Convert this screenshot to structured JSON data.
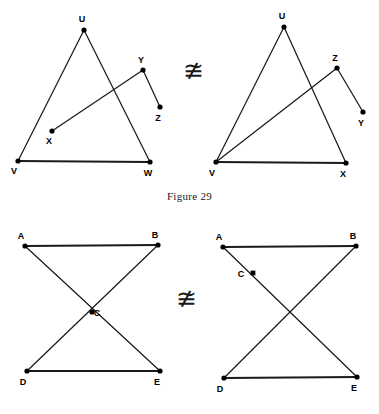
{
  "page": {
    "width": 379,
    "height": 414,
    "background_color": "#ffffff",
    "ink_color": "#1a1a1a"
  },
  "caption": {
    "text": "Figure 29"
  },
  "relations": [
    {
      "name": "top-relation",
      "symbol": "≇",
      "meaning": "not congruent to"
    },
    {
      "name": "bottom-relation",
      "symbol": "≇",
      "meaning": "not congruent to"
    }
  ],
  "figures": [
    {
      "id": "top-left",
      "row": "top",
      "side": "left",
      "viewbox": "0 0 190 188",
      "points": [
        {
          "id": "U",
          "label": "U",
          "x": 84,
          "y": 30,
          "marker": "dot",
          "label_dx": -2,
          "label_dy": -8
        },
        {
          "id": "V",
          "label": "V",
          "x": 18,
          "y": 161,
          "marker": "dot",
          "label_dx": -4,
          "label_dy": 13
        },
        {
          "id": "W",
          "label": "W",
          "x": 150,
          "y": 162,
          "marker": "dot",
          "label_dx": -2,
          "label_dy": 14
        },
        {
          "id": "X",
          "label": "X",
          "x": 52,
          "y": 131,
          "marker": "dot",
          "label_dx": -3,
          "label_dy": 13
        },
        {
          "id": "Y",
          "label": "Y",
          "x": 143,
          "y": 70,
          "marker": "dot",
          "label_dx": -2,
          "label_dy": -7
        },
        {
          "id": "Z",
          "label": "Z",
          "x": 160,
          "y": 107,
          "marker": "dot",
          "label_dx": -2,
          "label_dy": 14
        }
      ],
      "segments": [
        {
          "from": "U",
          "to": "V",
          "weight": "thin"
        },
        {
          "from": "U",
          "to": "W",
          "weight": "thin"
        },
        {
          "from": "V",
          "to": "W",
          "weight": "thick"
        },
        {
          "from": "X",
          "to": "Y",
          "weight": "thin"
        },
        {
          "from": "Y",
          "to": "Z",
          "weight": "thin"
        }
      ]
    },
    {
      "id": "top-right",
      "row": "top",
      "side": "right",
      "viewbox": "0 0 189 188",
      "points": [
        {
          "id": "U",
          "label": "U",
          "x": 94,
          "y": 27,
          "marker": "dot",
          "label_dx": -2,
          "label_dy": -8
        },
        {
          "id": "V",
          "label": "V",
          "x": 26,
          "y": 162,
          "marker": "dot",
          "label_dx": -4,
          "label_dy": 14
        },
        {
          "id": "X",
          "label": "X",
          "x": 156,
          "y": 163,
          "marker": "dot",
          "label_dx": -3,
          "label_dy": 14
        },
        {
          "id": "Z",
          "label": "Z",
          "x": 147,
          "y": 68,
          "marker": "dot",
          "label_dx": -2,
          "label_dy": -7
        },
        {
          "id": "Y",
          "label": "Y",
          "x": 173,
          "y": 112,
          "marker": "dot",
          "label_dx": -2,
          "label_dy": 14
        }
      ],
      "segments": [
        {
          "from": "U",
          "to": "V",
          "weight": "thin"
        },
        {
          "from": "U",
          "to": "X",
          "weight": "thin"
        },
        {
          "from": "V",
          "to": "X",
          "weight": "thick"
        },
        {
          "from": "V",
          "to": "Z",
          "weight": "thin"
        },
        {
          "from": "Z",
          "to": "Y",
          "weight": "thin"
        }
      ]
    },
    {
      "id": "bottom-left",
      "row": "bottom",
      "side": "left",
      "viewbox": "0 0 190 196",
      "points": [
        {
          "id": "A",
          "label": "A",
          "x": 25,
          "y": 28,
          "marker": "dot",
          "label_dx": -4,
          "label_dy": -7
        },
        {
          "id": "B",
          "label": "B",
          "x": 158,
          "y": 27,
          "marker": "dot",
          "label_dx": -3,
          "label_dy": -7
        },
        {
          "id": "C",
          "label": "C",
          "x": 92,
          "y": 94,
          "marker": "dot",
          "label_dx": 5,
          "label_dy": 4
        },
        {
          "id": "D",
          "label": "D",
          "x": 27,
          "y": 153,
          "marker": "dot",
          "label_dx": -4,
          "label_dy": 14
        },
        {
          "id": "E",
          "label": "E",
          "x": 160,
          "y": 153,
          "marker": "dot",
          "label_dx": -3,
          "label_dy": 14
        }
      ],
      "segments": [
        {
          "from": "A",
          "to": "B",
          "weight": "thick"
        },
        {
          "from": "A",
          "to": "E",
          "weight": "thin"
        },
        {
          "from": "B",
          "to": "D",
          "weight": "thin"
        },
        {
          "from": "D",
          "to": "E",
          "weight": "thick"
        }
      ]
    },
    {
      "id": "bottom-right",
      "row": "bottom",
      "side": "right",
      "viewbox": "0 0 189 196",
      "points": [
        {
          "id": "A",
          "label": "A",
          "x": 33,
          "y": 29,
          "marker": "dot",
          "label_dx": -4,
          "label_dy": -7
        },
        {
          "id": "B",
          "label": "B",
          "x": 166,
          "y": 28,
          "marker": "dot",
          "label_dx": -3,
          "label_dy": -7
        },
        {
          "id": "C",
          "label": "C",
          "x": 63,
          "y": 55,
          "marker": "square",
          "label_dx": -12,
          "label_dy": 4
        },
        {
          "id": "D",
          "label": "D",
          "x": 34,
          "y": 160,
          "marker": "dot",
          "label_dx": -4,
          "label_dy": 14
        },
        {
          "id": "E",
          "label": "E",
          "x": 167,
          "y": 159,
          "marker": "dot",
          "label_dx": -3,
          "label_dy": 14
        }
      ],
      "segments": [
        {
          "from": "A",
          "to": "B",
          "weight": "thick"
        },
        {
          "from": "A",
          "to": "E",
          "weight": "thin"
        },
        {
          "from": "B",
          "to": "D",
          "weight": "thin"
        },
        {
          "from": "D",
          "to": "E",
          "weight": "thick"
        }
      ]
    }
  ]
}
